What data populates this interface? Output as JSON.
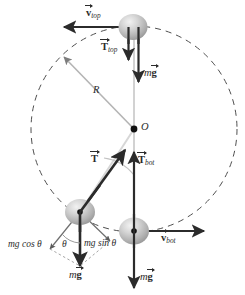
{
  "figure": {
    "background_color": "#ffffff",
    "ink_color": "#2b2b2b",
    "ball_color": "#b9b9b9",
    "dashed_circle_color": "#555555",
    "radius_line_color": "#b0b0b0"
  },
  "geometry": {
    "center": {
      "x": 134,
      "y": 129,
      "label": "O"
    },
    "radius_px": 103,
    "balls": [
      {
        "name": "ball-top",
        "x": 133,
        "y": 27,
        "r": 14
      },
      {
        "name": "ball-angled",
        "x": 80,
        "y": 212,
        "r": 14
      },
      {
        "name": "ball-bottom",
        "x": 134,
        "y": 231,
        "r": 14
      }
    ],
    "angle_theta_deg": 28
  },
  "labels": {
    "v_top": {
      "base": "v",
      "sub": "top",
      "vector": true,
      "bold": true
    },
    "t_top": {
      "base": "T",
      "sub": "top",
      "vector": true,
      "bold": true
    },
    "mg_top": {
      "m": "m",
      "base": "g",
      "vector": true,
      "bold": true
    },
    "radius": {
      "base": "R",
      "italic": true
    },
    "center": {
      "base": "O",
      "italic": true
    },
    "tension": {
      "base": "T",
      "sub": "",
      "vector": true,
      "bold": true
    },
    "t_bot": {
      "base": "T",
      "sub": "bot",
      "vector": true,
      "bold": true
    },
    "v_bot": {
      "base": "v",
      "sub": "bot",
      "vector": true,
      "bold": true
    },
    "mg_angled": {
      "m": "m",
      "base": "g",
      "vector": true,
      "bold": true
    },
    "mg_bottom": {
      "m": "m",
      "base": "g",
      "vector": true,
      "bold": true
    },
    "mg_cos": {
      "text": "mg cos",
      "symbol": "θ"
    },
    "mg_sin": {
      "text": "mg sin",
      "symbol": "θ"
    },
    "theta_center": {
      "symbol": "θ"
    },
    "theta_ball": {
      "symbol": "θ"
    }
  },
  "vectors": [
    {
      "name": "v-top-arrow",
      "from": [
        125,
        27
      ],
      "to": [
        64,
        27
      ],
      "weight": 2.2,
      "desc": "velocity at top, leftward"
    },
    {
      "name": "t-top-arrow",
      "from": [
        129,
        27
      ],
      "to": [
        129,
        62
      ],
      "weight": 2.2,
      "desc": "tension at top, downward"
    },
    {
      "name": "mg-top-arrow",
      "from": [
        139,
        27
      ],
      "to": [
        139,
        84
      ],
      "weight": 2.2,
      "desc": "weight at top, downward"
    },
    {
      "name": "tension-arrow",
      "from": [
        80,
        212
      ],
      "to": [
        124,
        150
      ],
      "weight": 2.6,
      "desc": "tension along string toward center"
    },
    {
      "name": "mg-angled-arrow",
      "from": [
        80,
        212
      ],
      "to": [
        80,
        268
      ],
      "weight": 2.6,
      "desc": "weight of angled ball, downward"
    },
    {
      "name": "t-bot-arrow",
      "from": [
        134,
        231
      ],
      "to": [
        134,
        152
      ],
      "weight": 2.2,
      "desc": "tension at bottom, upward"
    },
    {
      "name": "mg-bot-arrow",
      "from": [
        134,
        231
      ],
      "to": [
        134,
        288
      ],
      "weight": 2.2,
      "desc": "weight at bottom, downward"
    },
    {
      "name": "v-bot-arrow",
      "from": [
        142,
        231
      ],
      "to": [
        204,
        231
      ],
      "weight": 2.2,
      "desc": "velocity at bottom, rightward"
    },
    {
      "name": "mg-cos-component",
      "from": [
        80,
        212
      ],
      "to": [
        52,
        249
      ],
      "weight": 1.2,
      "desc": "mg cos theta component"
    },
    {
      "name": "mg-sin-component",
      "from": [
        80,
        212
      ],
      "to": [
        108,
        240
      ],
      "weight": 1.2,
      "desc": "mg sin theta component"
    }
  ]
}
